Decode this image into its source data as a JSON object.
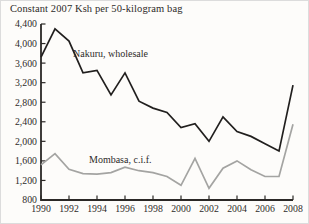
{
  "title": "Constant 2007 Ksh per 50-kilogram bag",
  "colors": {
    "background": "#fdfcfa",
    "axis": "#2b2826",
    "text": "#2e2b29",
    "series_nakuru": "#211f1e",
    "series_mombasa": "#a4a4a2"
  },
  "chart_data": {
    "type": "line",
    "title": "Constant 2007 Ksh per 50-kilogram bag",
    "xlabel": "",
    "ylabel": "Constant 2007 Ksh per 50-kilogram bag",
    "grid": false,
    "legend_position": "inline-annotations",
    "xlim": [
      1990,
      2008
    ],
    "ylim": [
      800,
      4400
    ],
    "xticks": [
      1990,
      1992,
      1994,
      1996,
      1998,
      2000,
      2002,
      2004,
      2006,
      2008
    ],
    "yticks": [
      800,
      1200,
      1600,
      2000,
      2400,
      2800,
      3200,
      3600,
      4000,
      4400
    ],
    "x": [
      1990,
      1991,
      1992,
      1993,
      1994,
      1995,
      1996,
      1997,
      1998,
      1999,
      2000,
      2001,
      2002,
      2003,
      2004,
      2005,
      2006,
      2007,
      2008
    ],
    "series": [
      {
        "name": "Nakuru, wholesale",
        "color": "#211f1e",
        "values": [
          3720,
          4300,
          4050,
          3400,
          3450,
          2950,
          3400,
          2820,
          2680,
          2590,
          2280,
          2360,
          2000,
          2500,
          2200,
          2100,
          1950,
          1800,
          3150
        ]
      },
      {
        "name": "Mombasa, c.i.f.",
        "color": "#a4a4a2",
        "values": [
          1520,
          1750,
          1430,
          1340,
          1330,
          1360,
          1470,
          1400,
          1360,
          1280,
          1100,
          1650,
          1040,
          1450,
          1600,
          1420,
          1280,
          1280,
          2350
        ]
      }
    ]
  }
}
